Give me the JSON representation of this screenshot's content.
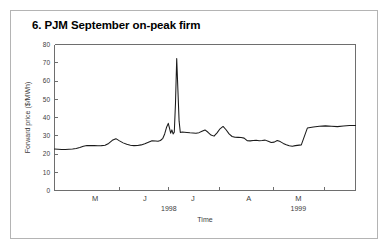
{
  "figure": {
    "title": "6. PJM September on-peak firm",
    "border_color": "#b4b4b4",
    "background": "#ffffff"
  },
  "chart_data": {
    "type": "line",
    "title": "6. PJM September on-peak firm",
    "xlabel": "Time",
    "ylabel": "Forward price ($/MWh)",
    "ylim": [
      0,
      80
    ],
    "xlim": [
      0,
      100
    ],
    "grid": false,
    "legend": null,
    "line_color": "#1a1a1a",
    "ytick_labels": [
      "80",
      "70",
      "60",
      "50",
      "40",
      "30",
      "20",
      "10",
      "0"
    ],
    "ytick_values": [
      80,
      70,
      60,
      50,
      40,
      30,
      20,
      10,
      0
    ],
    "xtick_labels": [
      "M",
      "J",
      "J",
      "A",
      "M"
    ],
    "xtick_positions": [
      13.5,
      30.0,
      46.0,
      64.5,
      81.0
    ],
    "xminor_positions": [
      0.0,
      21.6,
      38.0,
      54.8,
      72.6,
      89.6,
      100.0
    ],
    "year_labels": [
      {
        "text": "1998",
        "position": 38.0
      },
      {
        "text": "1999",
        "position": 81.0
      }
    ],
    "series": [
      {
        "name": "PJM September on-peak firm forward price",
        "x": [
          0.0,
          1.2,
          2.4,
          3.6,
          4.8,
          6.0,
          7.2,
          8.4,
          9.6,
          10.8,
          12.0,
          13.2,
          14.4,
          15.6,
          16.8,
          18.0,
          19.2,
          20.4,
          21.6,
          22.8,
          24.0,
          25.2,
          26.4,
          27.6,
          28.8,
          30.0,
          31.2,
          32.4,
          33.6,
          34.4,
          35.2,
          36.0,
          36.6,
          37.2,
          37.8,
          38.2,
          38.6,
          39.0,
          39.4,
          39.8,
          40.2,
          40.6,
          41.0,
          41.4,
          41.8,
          42.4,
          43.2,
          44.0,
          45.0,
          46.0,
          47.0,
          48.0,
          49.0,
          50.0,
          51.0,
          52.0,
          53.0,
          54.0,
          55.0,
          56.0,
          57.0,
          58.0,
          59.0,
          60.0,
          61.0,
          62.0,
          63.0,
          64.0,
          65.0,
          66.0,
          67.0,
          68.0,
          69.0,
          70.0,
          71.0,
          72.0,
          73.0,
          74.0,
          75.0,
          76.0,
          77.0,
          78.0,
          79.0,
          80.0,
          82.0,
          84.0,
          86.0,
          88.0,
          90.0,
          92.0,
          94.0,
          96.0,
          98.0,
          100.0
        ],
        "y": [
          22.7,
          22.6,
          22.5,
          22.5,
          22.6,
          22.7,
          23.0,
          23.5,
          24.2,
          24.6,
          24.7,
          24.6,
          24.5,
          24.6,
          24.8,
          25.8,
          27.5,
          28.4,
          27.2,
          26.1,
          25.3,
          24.8,
          24.6,
          24.7,
          25.0,
          25.6,
          26.4,
          27.2,
          27.1,
          27.0,
          27.4,
          28.6,
          31.0,
          34.5,
          36.8,
          34.2,
          31.4,
          33.2,
          31.0,
          32.0,
          48.0,
          72.3,
          55.0,
          38.0,
          31.8,
          32.0,
          31.9,
          31.8,
          31.6,
          31.5,
          31.4,
          31.7,
          32.5,
          33.2,
          31.9,
          30.4,
          29.8,
          31.6,
          33.8,
          35.1,
          33.3,
          31.0,
          29.6,
          29.2,
          29.1,
          29.0,
          28.7,
          27.3,
          27.2,
          27.4,
          27.5,
          27.3,
          27.4,
          27.6,
          27.0,
          26.3,
          26.5,
          27.4,
          26.8,
          25.8,
          25.1,
          24.5,
          24.3,
          24.6,
          25.0,
          34.2,
          34.8,
          35.2,
          35.4,
          35.2,
          35.0,
          35.3,
          35.6,
          35.6
        ]
      }
    ]
  }
}
